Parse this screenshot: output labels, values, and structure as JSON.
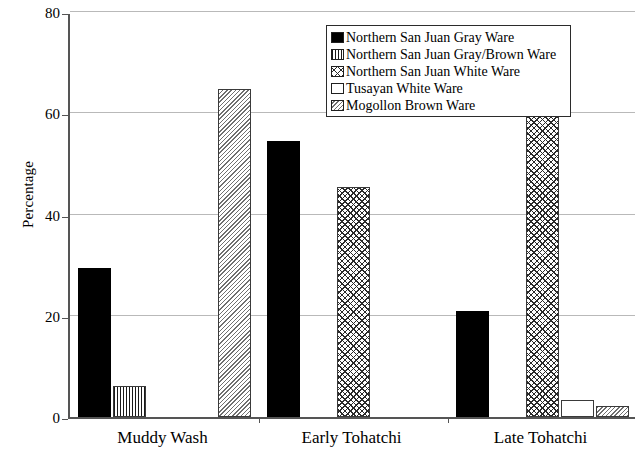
{
  "chart_data": {
    "type": "bar",
    "title": "",
    "xlabel": "",
    "ylabel": "Percentage",
    "ylim": [
      0,
      80
    ],
    "yticks": [
      0,
      20,
      40,
      60,
      80
    ],
    "grid": true,
    "legend_position": "top-center",
    "categories": [
      "Muddy Wash",
      "Early Tohatchi",
      "Late Tohatchi"
    ],
    "series": [
      {
        "name": "Northern San Juan Gray Ware",
        "swatch": "solid-black",
        "values": [
          29.5,
          54.5,
          21.0
        ]
      },
      {
        "name": "Northern San Juan Gray/Brown Ware",
        "swatch": "vertical-lines",
        "values": [
          6.1,
          0,
          0
        ]
      },
      {
        "name": "Northern San Juan White Ware",
        "swatch": "cross-hatch",
        "values": [
          0,
          45.5,
          73.7
        ]
      },
      {
        "name": "Tusayan White Ware",
        "swatch": "empty-white",
        "values": [
          0,
          0,
          3.3
        ]
      },
      {
        "name": "Mogollon Brown Ware",
        "swatch": "diagonal-hatch",
        "values": [
          64.8,
          0,
          2.2
        ]
      }
    ]
  },
  "colors": {
    "axis": "#555555",
    "gridline": "#b9b9b9",
    "bar_outline": "#3a3a3a",
    "series_solid": "#000000",
    "background": "#ffffff"
  },
  "caption": ""
}
